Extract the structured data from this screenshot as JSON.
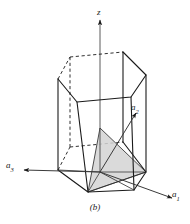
{
  "figure": {
    "caption": "(b)",
    "kind": "hexagonal-prism-unit-cell",
    "background_color": "#ffffff",
    "line_color": "#1a1a1a",
    "shade_color": "#d0d0d0"
  },
  "axes": {
    "z": {
      "label": "z",
      "direction": "up",
      "style": "solid-arrow"
    },
    "a1": {
      "label": "a",
      "subscript": "1",
      "direction": "lower-right",
      "style": "solid-arrow"
    },
    "a2": {
      "label": "a",
      "subscript": "2",
      "direction": "upper-right",
      "style": "solid-arrow"
    },
    "a3": {
      "label": "a",
      "subscript": "3",
      "direction": "left",
      "style": "solid-arrow"
    }
  },
  "geometry": {
    "top_hexagon": [
      [
        70,
        57
      ],
      [
        123,
        52
      ],
      [
        146,
        75
      ],
      [
        131,
        97
      ],
      [
        77,
        102
      ],
      [
        58,
        79
      ]
    ],
    "bottom_hexagon": [
      [
        70,
        147
      ],
      [
        123,
        142
      ],
      [
        146,
        172
      ],
      [
        134,
        190
      ],
      [
        88,
        192
      ],
      [
        58,
        170
      ]
    ],
    "hidden_vertices": [
      [
        70,
        57
      ],
      [
        70,
        147
      ]
    ],
    "shaded_plane": [
      [
        100,
        128
      ],
      [
        88,
        192
      ],
      [
        146,
        172
      ]
    ],
    "origin": [
      100,
      172
    ]
  },
  "shapes": {
    "prism": "hexagonal prism drawn in oblique projection with dashed hidden edges",
    "plane": "shaded triangular plane intersecting the prism interior"
  }
}
